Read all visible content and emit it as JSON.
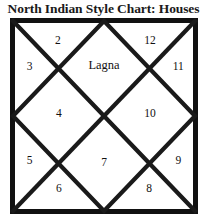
{
  "title": "North Indian Style Chart: Houses",
  "chart": {
    "style_name": "North Indian Style Chart",
    "border_color": "#000000",
    "line_color": "#1a1a1a",
    "background_color": "#ffffff",
    "ascendant_label": "Lagna",
    "houses": [
      {
        "id": "house-1",
        "label": "Lagna",
        "x": 50.0,
        "y": 24.0,
        "is_lagna": true
      },
      {
        "id": "house-2",
        "label": "2",
        "x": 25.5,
        "y": 11.0,
        "is_lagna": false
      },
      {
        "id": "house-3",
        "label": "3",
        "x": 10.5,
        "y": 24.5,
        "is_lagna": false
      },
      {
        "id": "house-4",
        "label": "4",
        "x": 26.0,
        "y": 48.5,
        "is_lagna": false
      },
      {
        "id": "house-5",
        "label": "5",
        "x": 10.5,
        "y": 72.5,
        "is_lagna": false
      },
      {
        "id": "house-6",
        "label": "6",
        "x": 26.0,
        "y": 86.5,
        "is_lagna": false
      },
      {
        "id": "house-7",
        "label": "7",
        "x": 50.0,
        "y": 73.5,
        "is_lagna": false
      },
      {
        "id": "house-8",
        "label": "8",
        "x": 74.0,
        "y": 86.5,
        "is_lagna": false
      },
      {
        "id": "house-9",
        "label": "9",
        "x": 89.5,
        "y": 72.5,
        "is_lagna": false
      },
      {
        "id": "house-10",
        "label": "10",
        "x": 74.5,
        "y": 48.5,
        "is_lagna": false
      },
      {
        "id": "house-11",
        "label": "11",
        "x": 89.5,
        "y": 24.5,
        "is_lagna": false
      },
      {
        "id": "house-12",
        "label": "12",
        "x": 74.5,
        "y": 11.0,
        "is_lagna": false
      }
    ]
  },
  "chart_data": {
    "type": "diagram",
    "title": "North Indian Style Chart: Houses",
    "categories": [
      "1",
      "2",
      "3",
      "4",
      "5",
      "6",
      "7",
      "8",
      "9",
      "10",
      "11",
      "12"
    ],
    "labels": [
      "Lagna",
      "2",
      "3",
      "4",
      "5",
      "6",
      "7",
      "8",
      "9",
      "10",
      "11",
      "12"
    ],
    "xlabel": "",
    "ylabel": "",
    "grid": false,
    "legend": "none"
  }
}
